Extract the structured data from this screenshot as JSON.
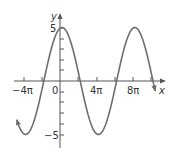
{
  "chart_data": {
    "type": "line",
    "title": "",
    "xlabel": "x",
    "ylabel": "y",
    "function": "y = 5 cos(x/4 - small phase shift)",
    "x_ticks": [
      "-4π",
      "0",
      "4π",
      "8π"
    ],
    "y_ticks": [
      "5",
      "-5"
    ],
    "xlim_pi": [
      -5,
      10
    ],
    "ylim": [
      -6,
      6
    ],
    "amplitude": 5,
    "period": "8π",
    "series": [
      {
        "name": "curve",
        "x_pi": [
          -4.7,
          -4.0,
          -2.0,
          0.2,
          2.2,
          4.2,
          6.2,
          8.2,
          10.2
        ],
        "y": [
          -4.8,
          -4.3,
          0,
          5,
          0,
          -5,
          0,
          5,
          0
        ]
      }
    ],
    "grid": false,
    "legend": null,
    "curve_color": "#6e6e6e",
    "axis_color": "#555555"
  },
  "labels": {
    "y_axis": "y",
    "x_axis": "x",
    "tick_neg4pi": "−4π",
    "tick_0": "0",
    "tick_4pi": "4π",
    "tick_8pi": "8π",
    "tick_5": "5",
    "tick_neg5": "−5"
  }
}
